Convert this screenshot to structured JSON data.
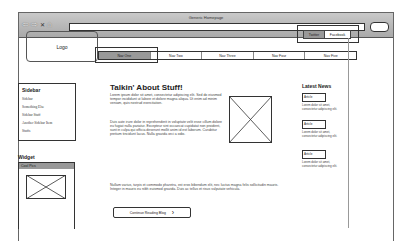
{
  "browser": {
    "title": "Generic Homepage",
    "nav_icons": [
      "back-icon",
      "forward-icon",
      "reload-icon",
      "home-icon"
    ],
    "url": "",
    "search": ""
  },
  "header": {
    "logo": "Logo",
    "social": [
      "Twitter",
      "Facebook"
    ]
  },
  "nav": {
    "items": [
      "Nav One",
      "Nav Two",
      "Nav Three",
      "Nav Four",
      "Nav Five"
    ],
    "active_index": 0
  },
  "sidebar": {
    "title": "Sidebar",
    "links": [
      "Sidebar",
      "Something Else",
      "Sidebar Stuff",
      "Another Sidebar Item",
      "Stuffs"
    ]
  },
  "widget": {
    "title": "Widget",
    "header": "Cool Pics"
  },
  "main": {
    "title": "Talkin' About Stuff!",
    "paragraphs": [
      "Lorem ipsum dolor sit amet, consectetur adipiscing elit. Sed do eiusmod tempor incididunt ut labore et dolore magna aliqua. Ut enim ad minim veniam, quis nostrud exercitation.",
      "Duis aute irure dolor in reprehenderit in voluptate velit esse cillum dolore eu fugiat nulla pariatur. Excepteur sint occaecat cupidatat non proident, sunt in culpa qui officia deserunt mollit anim id est laborum. Curabitur pretium tincidunt lacus. Nulla gravida orci a odio.",
      "Nullam varius, turpis et commodo pharetra, est eros bibendum elit, nec luctus magna felis sollicitudin mauris. Integer in mauris eu nibh euismod gravida. Duis ac tellus et risus vulputate vehicula."
    ],
    "more_button": "Continue Reading Blog"
  },
  "news": {
    "title": "Latest News",
    "items": [
      {
        "label": "Article",
        "text": "Lorem dolor sit amet, consectetur adipiscing elit."
      },
      {
        "label": "Article",
        "text": "Lorem dolor sit amet, consectetur adipiscing elit."
      },
      {
        "label": "Article",
        "text": "Lorem dolor sit amet, consectetur adipiscing elit."
      }
    ]
  }
}
